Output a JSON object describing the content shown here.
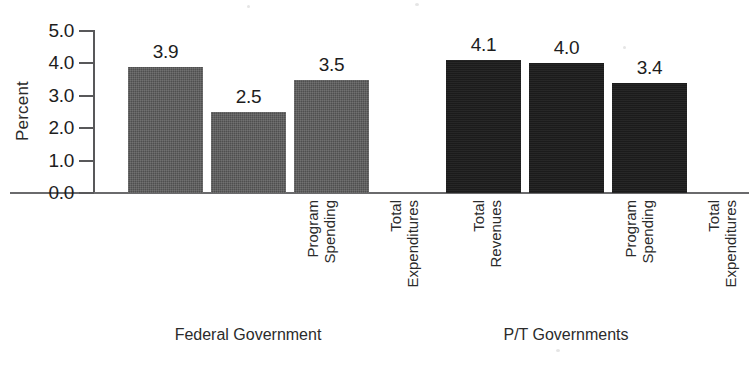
{
  "chart_data": {
    "type": "bar",
    "title": "",
    "xlabel": "",
    "ylabel": "Percent",
    "ylim": [
      0.0,
      5.0
    ],
    "ytick_labels": [
      "0.0",
      "1.0",
      "2.0",
      "3.0",
      "4.0",
      "5.0"
    ],
    "ytick_values": [
      0.0,
      1.0,
      2.0,
      3.0,
      4.0,
      5.0
    ],
    "grid": false,
    "legend": "none",
    "categories": [
      "Program Spending",
      "Total Expenditures",
      "Total Revenues"
    ],
    "category_lines": [
      [
        "Program",
        "Spending"
      ],
      [
        "Total",
        "Expenditures"
      ],
      [
        "Total",
        "Revenues"
      ]
    ],
    "groups": [
      {
        "name": "Federal Government",
        "color": "#4f4f4f",
        "values": [
          3.9,
          2.5,
          3.5
        ],
        "value_labels": [
          "3.9",
          "2.5",
          "3.5"
        ]
      },
      {
        "name": "P/T Governments",
        "color": "#1b1b1b",
        "values": [
          4.1,
          4.0,
          3.4
        ],
        "value_labels": [
          "4.1",
          "4.0",
          "3.4"
        ]
      }
    ],
    "series": [
      {
        "name": "Federal Government",
        "values": [
          3.9,
          2.5,
          3.5
        ]
      },
      {
        "name": "P/T Governments",
        "values": [
          4.1,
          4.0,
          3.4
        ]
      }
    ]
  }
}
